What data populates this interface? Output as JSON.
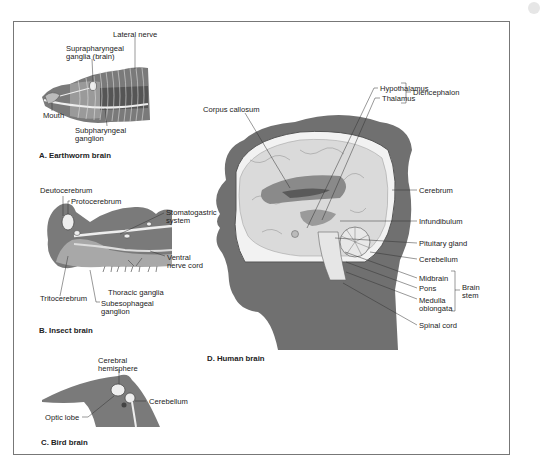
{
  "figure": {
    "panels": [
      {
        "id": "A",
        "caption": "A. Earthworm brain",
        "labels": [
          "Lateral nerve",
          "Suprapharyngeal",
          "ganglia (brain)",
          "Mouth",
          "Subpharyngeal",
          "ganglion"
        ]
      },
      {
        "id": "B",
        "caption": "B. Insect brain",
        "labels": [
          "Deutocerebrum",
          "Protocerebrum",
          "Stomatogastric",
          "system",
          "Ventral",
          "nerve cord",
          "Thoracic ganglia",
          "Tritocerebrum",
          "Subesophageal",
          "ganglion"
        ]
      },
      {
        "id": "C",
        "caption": "C. Bird brain",
        "labels": [
          "Cerebral",
          "hemisphere",
          "Cerebellum",
          "Optic lobe"
        ]
      },
      {
        "id": "D",
        "caption": "D. Human brain",
        "labels": [
          "Corpus callosum",
          "Hypothalamus",
          "Thalamus",
          "Diencephalon",
          "Cerebrum",
          "Infundibulum",
          "Pituitary gland",
          "Cerebellum",
          "Midbrain",
          "Pons",
          "Medulla",
          "oblongata",
          "Brain",
          "stem",
          "Spinal cord"
        ]
      }
    ]
  },
  "colors": {
    "tissue_dark": "#6e6e6e",
    "tissue_mid": "#9a9a9a",
    "tissue_light": "#c8c8c8",
    "nerve": "#ececec",
    "frame": "#777777"
  }
}
